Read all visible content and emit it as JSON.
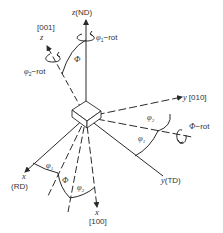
{
  "diagram": {
    "colors": {
      "line": "#2a2a2a",
      "text": "#333333",
      "background": "#ffffff"
    },
    "sample_axes": {
      "z": {
        "var": "z",
        "label": "(ND)"
      },
      "y": {
        "var": "y",
        "label": "(TD)"
      },
      "x": {
        "var": "x",
        "label": "(RD)"
      }
    },
    "crystal_axes": {
      "z": {
        "dir": "[001]",
        "var": "z"
      },
      "y": {
        "dir": "[010]",
        "var": "y"
      },
      "x": {
        "dir": "[100]",
        "var": "x"
      }
    },
    "rotations": {
      "phi1": {
        "symbol": "φ",
        "sub": "1",
        "suffix": "−rot"
      },
      "Phi": {
        "symbol": "Φ",
        "suffix": "−rot"
      },
      "phi2": {
        "symbol": "φ",
        "sub": "2",
        "suffix": "−rot"
      }
    },
    "angle_labels": {
      "Phi_top": "Φ",
      "phi1_left": {
        "symbol": "φ",
        "sub": "1"
      },
      "Phi_left": "Φ",
      "phi2_left": {
        "symbol": "φ",
        "sub": "2"
      },
      "phi2_right": {
        "symbol": "φ",
        "sub": "2"
      },
      "phi1_right": {
        "symbol": "φ",
        "sub": "1"
      }
    }
  }
}
